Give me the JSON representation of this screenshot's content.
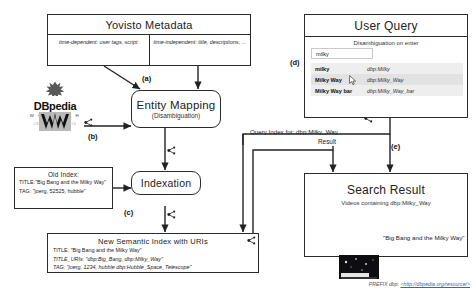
{
  "diagram": {
    "prefix_note": "PREFIX dbp: ",
    "prefix_uri": "<http://dbpedia.org/resource/>"
  },
  "metadata_box": {
    "title": "Yovisto Metadata",
    "cells": [
      "time-dependent: user tags, script",
      "time-independent: title, descriptions, ..."
    ]
  },
  "sources": {
    "dbpedia_label": "DBpedia",
    "wortschatz_label": "W O R T S C H A T Z",
    "wortschatz_sub": "UNIVERSITÄT LEIPZIG"
  },
  "entity_mapping": {
    "title": "Entity Mapping",
    "subtitle": "(Disambiguation)"
  },
  "indexation": {
    "title": "Indexation"
  },
  "old_index": {
    "title": "Old Index:",
    "lines": [
      "TITLE:\"Big Bang and the Milky Way\"",
      "TAG: \"joerg, 52525, hubble\""
    ]
  },
  "new_index": {
    "title": "New Semantic Index with URIs",
    "lines": [
      "TITLE: \"Big Bang and the Milky Way\"",
      "TITLE_URIs: \"dbp:Big_Bang, dbp:Milky_Way\"",
      "TAG: \"joerg, 1234, hubble dbp:Hubble_Space_Telescope\""
    ]
  },
  "user_query": {
    "title": "User Query",
    "subtitle": "Disambiguation on enter",
    "input_value": "milky",
    "input_placeholder": "milky",
    "suggestions": [
      {
        "term": "milky",
        "uri": "dbp:Milky"
      },
      {
        "term": "Milky Way",
        "uri": "dbp:Milky_Way"
      },
      {
        "term": "Milky Way bar",
        "uri": "dbp:Milky_Way_bar"
      }
    ]
  },
  "search_result": {
    "title": "Search Result",
    "subtitle": "Videos containing dbp:Milky_Way",
    "video_caption": "\"Big Bang and the Milky Way\""
  },
  "edge_labels": {
    "a": "(a)",
    "b": "(b)",
    "c": "(c)",
    "d": "(d)",
    "e": "(e)",
    "query_index": "Query Index for: dbp:Milky_Way",
    "result": "Result"
  }
}
